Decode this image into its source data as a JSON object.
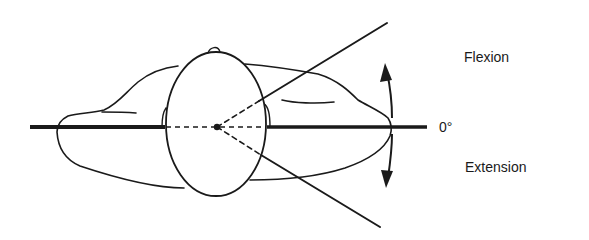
{
  "diagram": {
    "labels": {
      "upper": "Flexion",
      "zero": "0°",
      "lower": "Extension"
    },
    "colors": {
      "line": "#1a1a1a",
      "background": "#ffffff"
    }
  }
}
